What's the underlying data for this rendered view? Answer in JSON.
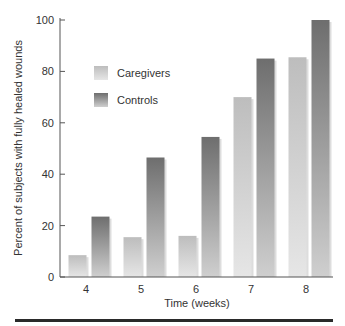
{
  "chart_data": {
    "type": "bar",
    "title": "",
    "xlabel": "Time (weeks)",
    "ylabel": "Percent of subjects with fully healed wounds",
    "categories": [
      "4",
      "5",
      "6",
      "7",
      "8"
    ],
    "series": [
      {
        "name": "Caregivers",
        "values": [
          8.5,
          15.5,
          16,
          70,
          85.5
        ],
        "color": "#c8c8c8"
      },
      {
        "name": "Controls",
        "values": [
          23.5,
          46.5,
          54.5,
          85,
          100
        ],
        "color": "#7a7a7a"
      }
    ],
    "ylim": [
      0,
      100
    ],
    "yticks": [
      "0",
      "20",
      "40",
      "60",
      "80",
      "100"
    ],
    "grid": false,
    "legend_position": "upper-left-inside"
  }
}
